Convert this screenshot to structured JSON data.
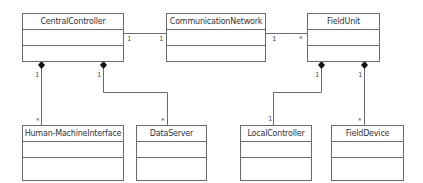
{
  "diagram": {
    "type": "UML class diagram",
    "classes": [
      {
        "id": "central",
        "name": "CentralController"
      },
      {
        "id": "network",
        "name": "CommunicationNetwork"
      },
      {
        "id": "fieldunit",
        "name": "FieldUnit"
      },
      {
        "id": "hmi",
        "name": "Human-MachineInterface"
      },
      {
        "id": "dataserver",
        "name": "DataServer"
      },
      {
        "id": "localctrl",
        "name": "LocalController"
      },
      {
        "id": "fielddevice",
        "name": "FieldDevice"
      }
    ],
    "relations": [
      {
        "from": "central",
        "to": "network",
        "kind": "association",
        "from_mult": "1",
        "to_mult": "1"
      },
      {
        "from": "network",
        "to": "fieldunit",
        "kind": "association",
        "from_mult": "1",
        "to_mult": "*"
      },
      {
        "from": "central",
        "to": "hmi",
        "kind": "composition",
        "from_mult": "1",
        "to_mult": "*"
      },
      {
        "from": "central",
        "to": "dataserver",
        "kind": "composition",
        "from_mult": "1",
        "to_mult": "*"
      },
      {
        "from": "fieldunit",
        "to": "localctrl",
        "kind": "composition",
        "from_mult": "1",
        "to_mult": "1"
      },
      {
        "from": "fieldunit",
        "to": "fielddevice",
        "kind": "composition",
        "from_mult": "1",
        "to_mult": "*"
      }
    ]
  },
  "colors": {
    "line": "#6b6b6b",
    "text": "#333333"
  }
}
